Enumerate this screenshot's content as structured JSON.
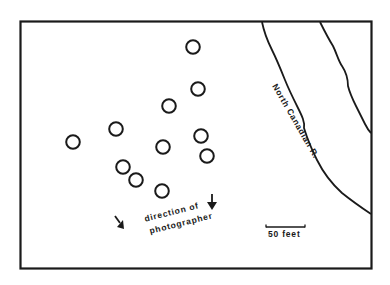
{
  "map": {
    "river_label": "North Canadian R.",
    "direction_label_line1": "direction of",
    "direction_label_line2": "photographer",
    "scale_label": "50 feet",
    "colors": {
      "ink": "#1a1a1a",
      "background": "#ffffff"
    },
    "features": {
      "circles": [
        {
          "x": 193,
          "y": 47
        },
        {
          "x": 198,
          "y": 89
        },
        {
          "x": 169,
          "y": 106
        },
        {
          "x": 116,
          "y": 129
        },
        {
          "x": 73,
          "y": 142
        },
        {
          "x": 163,
          "y": 147
        },
        {
          "x": 201,
          "y": 136
        },
        {
          "x": 207,
          "y": 156
        },
        {
          "x": 123,
          "y": 167
        },
        {
          "x": 136,
          "y": 180
        },
        {
          "x": 162,
          "y": 191
        }
      ],
      "arrows": [
        {
          "name": "arrow-left",
          "direction": "down-right"
        },
        {
          "name": "arrow-right",
          "direction": "down"
        }
      ]
    }
  }
}
